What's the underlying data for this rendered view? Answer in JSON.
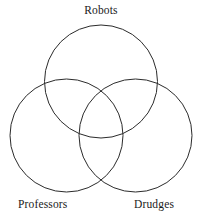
{
  "figure": {
    "type": "venn-diagram-3-set",
    "width": 202,
    "height": 219,
    "background_color": "#ffffff",
    "stroke_color": "#2b2b2b",
    "stroke_width": 1,
    "labels": {
      "top": "Robots",
      "bottom_left": "Professors",
      "bottom_right": "Drudges"
    },
    "circles": [
      {
        "name": "robots-circle",
        "label": "Robots",
        "cx": 101,
        "cy": 81.5,
        "r": 56.5
      },
      {
        "name": "professors-circle",
        "label": "Professors",
        "cx": 66.5,
        "cy": 135.5,
        "r": 56.5
      },
      {
        "name": "drudges-circle",
        "label": "Drudges",
        "cx": 135.5,
        "cy": 135.5,
        "r": 56.5
      }
    ]
  }
}
